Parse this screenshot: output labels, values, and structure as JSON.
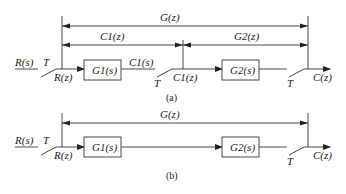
{
  "diagram_a": {
    "caption": "(a)",
    "input_label": "R(s)",
    "sampler1_label": "T",
    "sampled_input_label": "R(z)",
    "block1_label": "G1(s)",
    "block1_output_label": "C1(s)",
    "sampler2_label": "T",
    "intermediate_label": "C1(z)",
    "block2_label": "G2(s)",
    "sampler3_label": "T",
    "output_label": "C(z)",
    "span_total_label": "G(z)",
    "span_first_label": "C1(z)",
    "span_second_label": "G2(z)"
  },
  "diagram_b": {
    "caption": "(b)",
    "input_label": "R(s)",
    "sampler1_label": "T",
    "sampled_input_label": "R(z)",
    "block1_label": "G1(s)",
    "block2_label": "G2(s)",
    "sampler2_label": "T",
    "output_label": "C(z)",
    "span_total_label": "G(z)"
  }
}
